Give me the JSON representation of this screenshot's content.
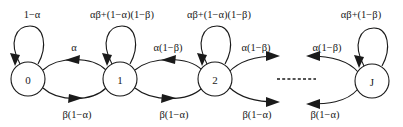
{
  "figure": {
    "type": "state-transition-diagram",
    "background_color": "#ffffff",
    "stroke_color": "#1a1a1a",
    "width": 403,
    "height": 127
  },
  "nodes": [
    {
      "id": "s0",
      "label": "0",
      "cx": 28,
      "cy": 79,
      "r": 17
    },
    {
      "id": "s1",
      "label": "1",
      "cx": 120,
      "cy": 79,
      "r": 17
    },
    {
      "id": "s2",
      "label": "2",
      "cx": 215,
      "cy": 79,
      "r": 17
    },
    {
      "id": "sJ",
      "label": "J",
      "cx": 372,
      "cy": 81,
      "r": 17
    }
  ],
  "self_loops": [
    {
      "id": "loop0",
      "node": "s0",
      "label": "1−α",
      "label_x": 32,
      "label_y": 14
    },
    {
      "id": "loop1",
      "node": "s1",
      "label": "αβ+(1−α)(1−β)",
      "label_x": 122,
      "label_y": 14
    },
    {
      "id": "loop2",
      "node": "s2",
      "label": "αβ+(1−α)(1−β)",
      "label_x": 219,
      "label_y": 14
    },
    {
      "id": "loopJ",
      "node": "sJ",
      "label": "αβ+(1−β)",
      "label_x": 361,
      "label_y": 14
    }
  ],
  "forward_edges": [
    {
      "id": "e01",
      "from": "s0",
      "to": "s1",
      "label": "α",
      "label_x": 74,
      "label_y": 47
    },
    {
      "id": "e12",
      "from": "s1",
      "to": "s2",
      "label": "α(1−β)",
      "label_x": 168,
      "label_y": 47
    },
    {
      "id": "e2x",
      "from": "s2",
      "to": "dots",
      "label": "α(1−β)",
      "label_x": 256,
      "label_y": 47
    },
    {
      "id": "exJ",
      "from": "dots",
      "to": "sJ",
      "label": "α(1−β)",
      "label_x": 327,
      "label_y": 47
    }
  ],
  "backward_edges": [
    {
      "id": "e10",
      "from": "s1",
      "to": "s0",
      "label": "β(1−α)",
      "label_x": 77,
      "label_y": 114
    },
    {
      "id": "e21",
      "from": "s2",
      "to": "s1",
      "label": "β(1−α)",
      "label_x": 174,
      "label_y": 114
    },
    {
      "id": "ex2",
      "from": "dots",
      "to": "s2",
      "label": "β(1−α)",
      "label_x": 257,
      "label_y": 114
    },
    {
      "id": "eJx",
      "from": "sJ",
      "to": "dots",
      "label": "β(1−α)",
      "label_x": 325,
      "label_y": 114
    }
  ],
  "ellipsis": {
    "id": "dots",
    "label": "----------",
    "x1": 277,
    "x2": 316,
    "y": 79
  }
}
